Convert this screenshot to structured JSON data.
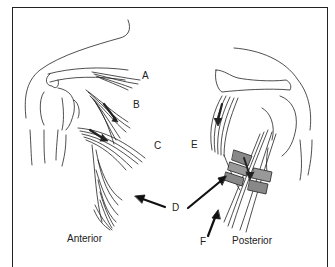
{
  "figure": {
    "labels": [
      {
        "id": "A",
        "text": "A"
      },
      {
        "id": "B",
        "text": "B"
      },
      {
        "id": "C",
        "text": "C"
      },
      {
        "id": "D",
        "text": "D"
      },
      {
        "id": "E",
        "text": "E"
      },
      {
        "id": "F",
        "text": "F"
      }
    ],
    "captions": {
      "anterior": "Anterior",
      "posterior": "Posterior"
    }
  }
}
